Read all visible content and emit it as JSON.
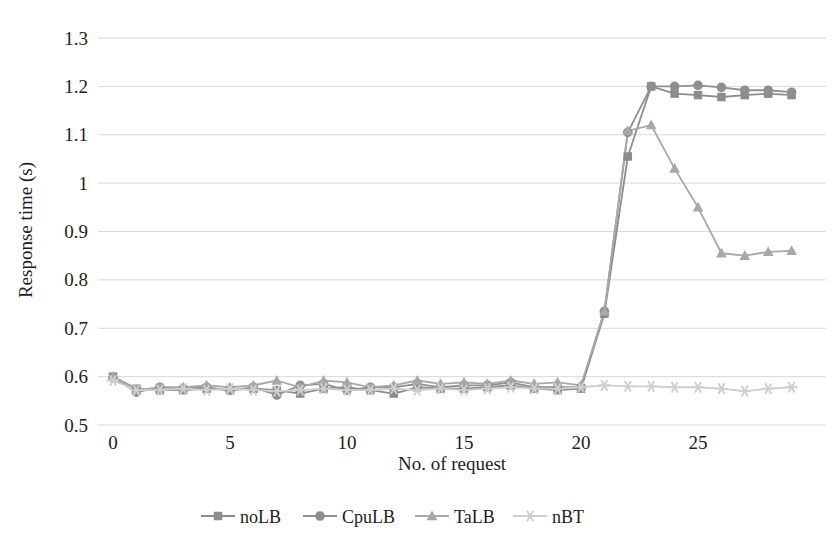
{
  "chart_data": {
    "type": "line",
    "title": "",
    "xlabel": "No. of request",
    "ylabel": "Response time (s)",
    "xlim": [
      -0.5,
      30
    ],
    "ylim": [
      0.5,
      1.3
    ],
    "xticks": [
      "0",
      "5",
      "10",
      "15",
      "20",
      "25"
    ],
    "xtick_values": [
      0,
      5,
      10,
      15,
      20,
      25
    ],
    "yticks": [
      "0.5",
      "0.6",
      "0.7",
      "0.8",
      "0.9",
      "1",
      "1.1",
      "1.2",
      "1.3"
    ],
    "ytick_values": [
      0.5,
      0.6,
      0.7,
      0.8,
      0.9,
      1.0,
      1.1,
      1.2,
      1.3
    ],
    "grid": true,
    "grid_axis": "y",
    "grid_color": "#d9d9d9",
    "legend_position": "bottom",
    "x": [
      0,
      1,
      2,
      3,
      4,
      5,
      6,
      7,
      8,
      9,
      10,
      11,
      12,
      13,
      14,
      15,
      16,
      17,
      18,
      19,
      20,
      21,
      22,
      23,
      24,
      25,
      26,
      27,
      28,
      29
    ],
    "series": [
      {
        "name": "noLB",
        "marker": "square",
        "color": "#8c8c8c",
        "values": [
          0.6,
          0.575,
          0.572,
          0.572,
          0.575,
          0.572,
          0.575,
          0.572,
          0.565,
          0.575,
          0.578,
          0.572,
          0.565,
          0.578,
          0.575,
          0.575,
          0.578,
          0.582,
          0.575,
          0.572,
          0.575,
          0.73,
          1.055,
          1.2,
          1.185,
          1.182,
          1.178,
          1.182,
          1.185,
          1.182
        ]
      },
      {
        "name": "CpuLB",
        "marker": "circle",
        "color": "#8f8f8f",
        "values": [
          0.598,
          0.568,
          0.578,
          0.575,
          0.578,
          0.572,
          0.578,
          0.562,
          0.582,
          0.585,
          0.572,
          0.578,
          0.578,
          0.585,
          0.578,
          0.582,
          0.582,
          0.588,
          0.578,
          0.578,
          0.578,
          0.735,
          1.105,
          1.2,
          1.2,
          1.202,
          1.198,
          1.192,
          1.192,
          1.188
        ]
      },
      {
        "name": "TaLB",
        "marker": "triangle",
        "color": "#a8a8a8",
        "values": [
          0.6,
          0.572,
          0.578,
          0.578,
          0.582,
          0.578,
          0.582,
          0.592,
          0.578,
          0.592,
          0.588,
          0.578,
          0.582,
          0.592,
          0.585,
          0.588,
          0.585,
          0.592,
          0.585,
          0.588,
          0.582,
          0.735,
          1.108,
          1.12,
          1.03,
          0.95,
          0.855,
          0.85,
          0.858,
          0.86
        ]
      },
      {
        "name": "nBT",
        "marker": "star",
        "color": "#cfcfcf",
        "values": [
          0.592,
          0.572,
          0.572,
          0.575,
          0.572,
          0.575,
          0.572,
          0.57,
          0.572,
          0.575,
          0.572,
          0.572,
          0.575,
          0.572,
          0.575,
          0.572,
          0.575,
          0.578,
          0.575,
          0.575,
          0.578,
          0.582,
          0.58,
          0.58,
          0.578,
          0.578,
          0.575,
          0.57,
          0.575,
          0.578
        ]
      }
    ]
  },
  "legend": {
    "items": [
      {
        "label": "noLB"
      },
      {
        "label": "CpuLB"
      },
      {
        "label": "TaLB"
      },
      {
        "label": "nBT"
      }
    ]
  },
  "axes": {
    "y_title": "Response time (s)",
    "x_title": "No. of request"
  }
}
